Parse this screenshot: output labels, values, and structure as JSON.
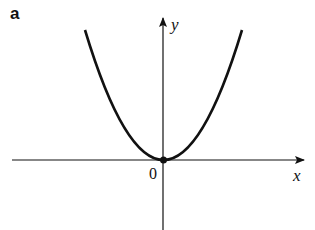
{
  "panel_label": "a",
  "axes": {
    "x_label": "x",
    "y_label": "y",
    "origin_label": "0"
  },
  "curve": {
    "equation_shape": "parabola y = kx^2",
    "vertex": [
      0,
      0
    ],
    "vertex_marked": true
  },
  "colors": {
    "ink": "#111111",
    "background": "#ffffff"
  }
}
